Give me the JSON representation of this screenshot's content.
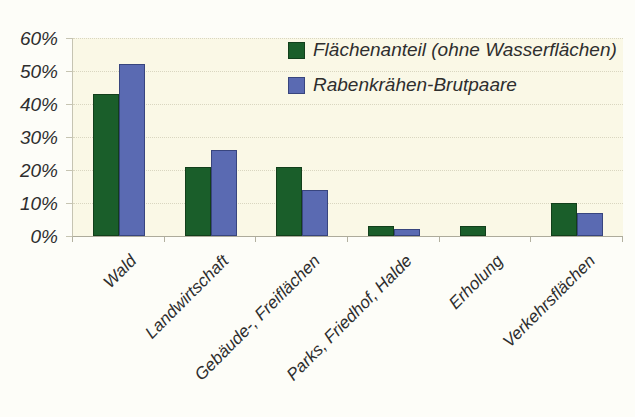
{
  "figure": {
    "background": "#fdfdf8",
    "plot_background": "#faf8e6",
    "gridline_color": "#d9d6c0",
    "axis_color": "#b3b1a0",
    "text_color": "#2e2e2e"
  },
  "chart_data": {
    "type": "bar",
    "title": "",
    "xlabel": "",
    "ylabel": "",
    "categories": [
      "Wald",
      "Landwirtschaft",
      "Gebäude-, Freiflächen",
      "Parks, Friedhof, Halde",
      "Erholung",
      "Verkehrsflächen"
    ],
    "series": [
      {
        "name": "Flächenanteil (ohne Wasserflächen)",
        "color": "#1a5e2a",
        "border_color": "#123f1b",
        "values": [
          43,
          21,
          21,
          3,
          3,
          10
        ]
      },
      {
        "name": "Rabenkrähen-Brutpaare",
        "color": "#5a6ab2",
        "border_color": "#38457e",
        "values": [
          52,
          26,
          14,
          2,
          0,
          7
        ]
      }
    ],
    "ylim": [
      0,
      60
    ],
    "y_tick_step": 10,
    "y_tick_labels": [
      "0%",
      "10%",
      "20%",
      "30%",
      "40%",
      "50%",
      "60%"
    ],
    "grid": "horizontal-dotted",
    "legend_position": "top-right-inside",
    "x_label_rotation_deg": 45
  }
}
